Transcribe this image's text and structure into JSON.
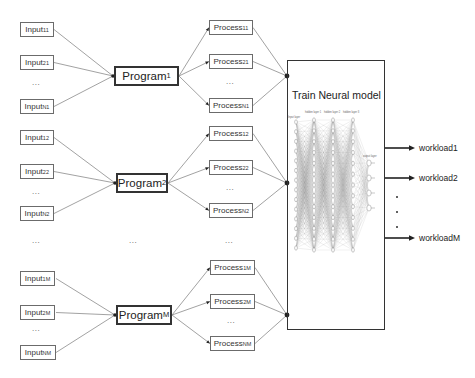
{
  "diagram": {
    "groups": [
      {
        "program": {
          "base": "Program",
          "sub": "1"
        },
        "inputs": [
          {
            "base": "Input",
            "sub": "11"
          },
          {
            "base": "Input",
            "sub": "21"
          },
          {
            "base": "Input",
            "sub": "N1"
          }
        ],
        "processes": [
          {
            "base": "Process",
            "sub": "11"
          },
          {
            "base": "Process",
            "sub": "21"
          },
          {
            "base": "Process",
            "sub": "N1"
          }
        ]
      },
      {
        "program": {
          "base": "Program",
          "sub": "2"
        },
        "inputs": [
          {
            "base": "Input",
            "sub": "12"
          },
          {
            "base": "Input",
            "sub": "22"
          },
          {
            "base": "Input",
            "sub": "N2"
          }
        ],
        "processes": [
          {
            "base": "Process",
            "sub": "12"
          },
          {
            "base": "Process",
            "sub": "22"
          },
          {
            "base": "Process",
            "sub": "N2"
          }
        ]
      },
      {
        "program": {
          "base": "Program",
          "sub": "M"
        },
        "inputs": [
          {
            "base": "Input",
            "sub": "1M"
          },
          {
            "base": "Input",
            "sub": "2M"
          },
          {
            "base": "Input",
            "sub": "NM"
          }
        ],
        "processes": [
          {
            "base": "Process",
            "sub": "1M"
          },
          {
            "base": "Process",
            "sub": "2M"
          },
          {
            "base": "Process",
            "sub": "NM"
          }
        ]
      }
    ],
    "ellipsis": "...",
    "model": {
      "title": "Train Neural model",
      "nn_labels": {
        "input_layer": "Input layer",
        "hidden_layers": [
          "hidden layer 1",
          "hidden layer 2",
          "hidden layer 3"
        ],
        "output_layer": "output layer"
      }
    },
    "outputs": [
      "workload1",
      "workload2",
      "workloadM"
    ]
  },
  "colors": {
    "box_border": "#6b6b6b",
    "program_border": "#333333",
    "connector": "#8a8a8a",
    "arrow": "#222222"
  }
}
